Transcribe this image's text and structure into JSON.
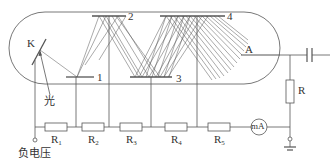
{
  "diagram": {
    "colors": {
      "line": "#555555",
      "text": "#333333",
      "background": "#ffffff"
    },
    "labels": {
      "cathode": "K",
      "anode": "A",
      "light": "光",
      "negative_voltage": "负电压",
      "output_resistor": "R",
      "ammeter": "mA"
    },
    "dynodes": [
      {
        "id": "1",
        "label": "1"
      },
      {
        "id": "2",
        "label": "2"
      },
      {
        "id": "3",
        "label": "3"
      },
      {
        "id": "4",
        "label": "4"
      }
    ],
    "divider_resistors": [
      {
        "base": "R",
        "sub": "1"
      },
      {
        "base": "R",
        "sub": "2"
      },
      {
        "base": "R",
        "sub": "3"
      },
      {
        "base": "R",
        "sub": "4"
      },
      {
        "base": "R",
        "sub": "5"
      }
    ]
  }
}
